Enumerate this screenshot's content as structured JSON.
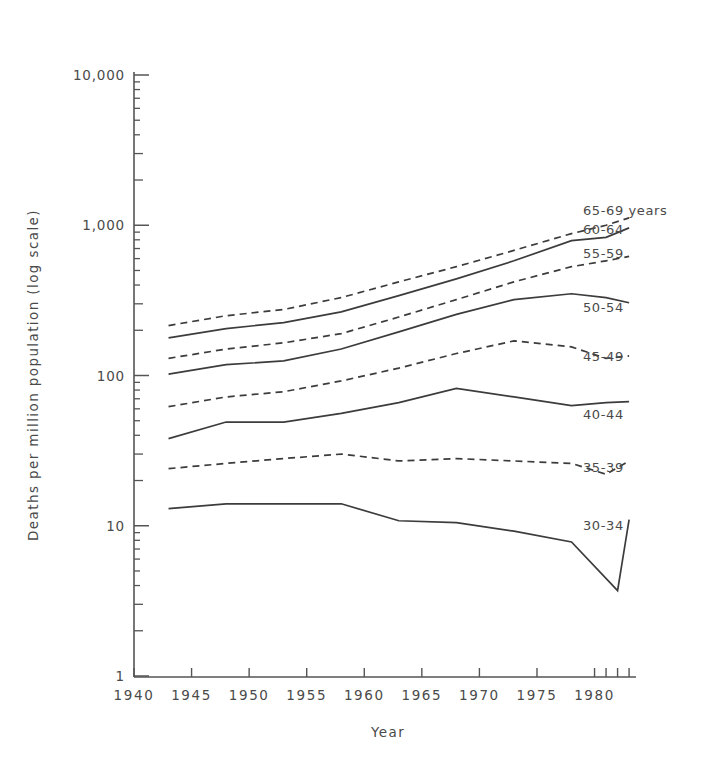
{
  "chart_data": {
    "type": "line",
    "title": "",
    "xlabel": "Year",
    "ylabel": "Deaths per million population (log scale)",
    "xlim": [
      1940,
      1983.6
    ],
    "ylim": [
      1,
      10000
    ],
    "yscale": "log",
    "grid": false,
    "legend_position": "right-inline",
    "y_tick_labels": [
      "10,000",
      "1,000",
      "100",
      "10",
      "1"
    ],
    "y_tick_values": [
      10000,
      1000,
      100,
      10,
      1
    ],
    "x_tick_labels": [
      "1940",
      "1945",
      "1950",
      "1955",
      "1960",
      "1965",
      "1970",
      "1975",
      "1980"
    ],
    "x_tick_values": [
      1940,
      1945,
      1950,
      1955,
      1960,
      1965,
      1970,
      1975,
      1980
    ],
    "x_extra_ticks": [
      1981,
      1982,
      1983
    ],
    "series": [
      {
        "name": "65-69 years",
        "label": "65-69 years",
        "style": "dashed",
        "x": [
          1943,
          1948,
          1953,
          1958,
          1963,
          1968,
          1973,
          1978,
          1981,
          1983
        ],
        "values": [
          215,
          250,
          275,
          330,
          420,
          530,
          680,
          880,
          1000,
          1120
        ]
      },
      {
        "name": "60-64",
        "label": "60-64",
        "style": "solid",
        "x": [
          1943,
          1948,
          1953,
          1958,
          1963,
          1968,
          1973,
          1978,
          1981,
          1983
        ],
        "values": [
          178,
          205,
          225,
          265,
          340,
          440,
          580,
          790,
          830,
          960
        ]
      },
      {
        "name": "55-59",
        "label": "55-59",
        "style": "dashed",
        "x": [
          1943,
          1948,
          1953,
          1958,
          1963,
          1968,
          1973,
          1978,
          1981,
          1983
        ],
        "values": [
          130,
          150,
          165,
          190,
          245,
          320,
          420,
          530,
          580,
          620
        ]
      },
      {
        "name": "50-54",
        "label": "50-54",
        "style": "solid",
        "x": [
          1943,
          1948,
          1953,
          1958,
          1963,
          1968,
          1973,
          1978,
          1981,
          1983
        ],
        "values": [
          102,
          118,
          125,
          150,
          195,
          255,
          320,
          350,
          330,
          305
        ]
      },
      {
        "name": "45-49",
        "label": "45-49",
        "style": "dashed",
        "x": [
          1943,
          1948,
          1953,
          1958,
          1963,
          1968,
          1973,
          1978,
          1981,
          1983
        ],
        "values": [
          62,
          72,
          78,
          92,
          112,
          140,
          170,
          155,
          130,
          135
        ]
      },
      {
        "name": "40-44",
        "label": "40-44",
        "style": "solid",
        "x": [
          1943,
          1948,
          1953,
          1958,
          1963,
          1968,
          1973,
          1978,
          1981,
          1983
        ],
        "values": [
          38,
          49,
          49,
          56,
          66,
          82,
          72,
          63,
          66,
          67
        ]
      },
      {
        "name": "35-39",
        "label": "35-39",
        "style": "dashed",
        "x": [
          1943,
          1948,
          1953,
          1958,
          1963,
          1968,
          1973,
          1978,
          1981,
          1983
        ],
        "values": [
          24,
          26,
          28,
          30,
          27,
          28,
          27,
          26,
          22,
          27
        ]
      },
      {
        "name": "30-34",
        "label": "30-34",
        "style": "solid",
        "x": [
          1943,
          1948,
          1953,
          1958,
          1963,
          1968,
          1973,
          1978,
          1982,
          1983
        ],
        "values": [
          13,
          14,
          14,
          14,
          10.8,
          10.5,
          9.2,
          7.8,
          3.7,
          11
        ]
      }
    ]
  },
  "axis_titles": {
    "x": "Year",
    "y": "Deaths per million population (log scale)"
  }
}
